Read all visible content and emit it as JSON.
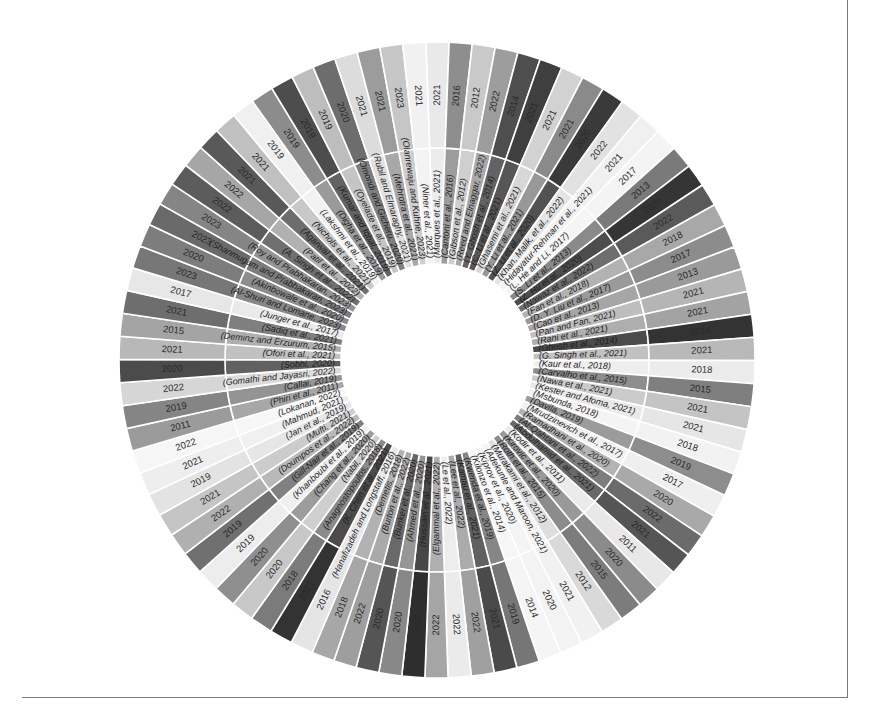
{
  "chart_data": {
    "type": "sunburst",
    "title": "",
    "center": {
      "x": 437,
      "y": 360
    },
    "radii": {
      "inner": 96,
      "split": 212,
      "outer": 318
    },
    "start_angle_deg": -2,
    "entries": [
      {
        "author": "(Marques et al., 2021)",
        "year": 2021,
        "shade": "#e9e9e9"
      },
      {
        "author": "(Cantoni et al., 2016)",
        "year": 2016,
        "shade": "#8e8e8e"
      },
      {
        "author": "(Gibson et al., 2012)",
        "year": 2012,
        "shade": "#c9c9c9"
      },
      {
        "author": "(Reed and Elnaggar, 2022)",
        "year": 2022,
        "shade": "#9d9d9d"
      },
      {
        "author": "(Y. Ghosh et al., 2014)",
        "year": 2014,
        "shade": "#4e4e4e"
      },
      {
        "author": "(C. Li et al., 2021)",
        "year": 2021,
        "shade": "#3f3f3f"
      },
      {
        "author": "(Ghasemi et al., 2021)",
        "year": 2021,
        "shade": "#d2d2d2"
      },
      {
        "author": "(Y. Li et al., 2021)",
        "year": 2021,
        "shade": "#8a8a8a"
      },
      {
        "author": "(Z. Li et al., 2020)",
        "year": 2020,
        "shade": "#3a3a3a"
      },
      {
        "author": "(Khan, Malik, et al., 2022)",
        "year": 2022,
        "shade": "#e2e2e2"
      },
      {
        "author": "(Hidayatur-Rehman et al., 2021)",
        "year": 2021,
        "shade": "#f0f0f0"
      },
      {
        "author": "(L. He and Li, 2017)",
        "year": 2017,
        "shade": "#f4f4f4"
      },
      {
        "author": "(S. Li et al., 2013)",
        "year": 2013,
        "shade": "#7a7a7a"
      },
      {
        "author": "(Z. Hu et al., 2020)",
        "year": 2020,
        "shade": "#353535"
      },
      {
        "author": "(Nawaz et al., 2022)",
        "year": 2022,
        "shade": "#5a5a5a"
      },
      {
        "author": "(Fan et al., 2018)",
        "year": 2018,
        "shade": "#a8a8a8"
      },
      {
        "author": "(D. Y. Liu et al., 2017)",
        "year": 2017,
        "shade": "#8c8c8c"
      },
      {
        "author": "(Cao et al., 2013)",
        "year": 2013,
        "shade": "#9a9a9a"
      },
      {
        "author": "(Pan and Fan, 2021)",
        "year": 2021,
        "shade": "#b5b5b5"
      },
      {
        "author": "(Rani et al., 2021)",
        "year": 2021,
        "shade": "#a3a3a3"
      },
      {
        "author": "(Ghosh et al., 2014)",
        "year": 2014,
        "shade": "#333333"
      },
      {
        "author": "(G. Singh et al., 2021)",
        "year": 2021,
        "shade": "#b9b9b9"
      },
      {
        "author": "(Kaur et al., 2018)",
        "year": 2018,
        "shade": "#ececec"
      },
      {
        "author": "(Carvalho et al., 2015)",
        "year": 2015,
        "shade": "#7f7f7f"
      },
      {
        "author": "(Nawa et al., 2021)",
        "year": 2021,
        "shade": "#c4c4c4"
      },
      {
        "author": "(Kester and Afoma, 2021)",
        "year": 2021,
        "shade": "#e6e6e6"
      },
      {
        "author": "(Msbunda, 2018)",
        "year": 2018,
        "shade": "#f2f2f2"
      },
      {
        "author": "(Davila, 2019)",
        "year": 2019,
        "shade": "#8d8d8d"
      },
      {
        "author": "(Mrudzinevich et al., 2017)",
        "year": 2017,
        "shade": "#efefef"
      },
      {
        "author": "(Ramadhani et al., 2020)",
        "year": 2020,
        "shade": "#a9a9a9"
      },
      {
        "author": "(Al-Qahtani et al., 2022)",
        "year": 2022,
        "shade": "#6b6b6b"
      },
      {
        "author": "(Abdulhamid et al., 2021)",
        "year": 2021,
        "shade": "#555555"
      },
      {
        "author": "(Kodir et al., 2011)",
        "year": 2011,
        "shade": "#e8e8e8"
      },
      {
        "author": "(Kirovic et al., 2020)",
        "year": 2020,
        "shade": "#8b8b8b"
      },
      {
        "author": "(Roth et al., 2015)",
        "year": 2015,
        "shade": "#7c7c7c"
      },
      {
        "author": "(Murakami et al., 2012)",
        "year": 2012,
        "shade": "#d9d9d9"
      },
      {
        "author": "(Adekunle and Maroon, 2021)",
        "year": 2021,
        "shade": "#f1f1f1"
      },
      {
        "author": "(Kiprov et al., 2020)",
        "year": 2020,
        "shade": "#f3f3f3"
      },
      {
        "author": "(Kilonzo et al., 2014)",
        "year": 2014,
        "shade": "#f5f5f5"
      },
      {
        "author": "(Kwenda et al., 2019)",
        "year": 2019,
        "shade": "#767676"
      },
      {
        "author": "(Kamau et al., 2021)",
        "year": 2021,
        "shade": "#4a4a4a"
      },
      {
        "author": "(Lee et al., 2022)",
        "year": 2022,
        "shade": "#a0a0a0"
      },
      {
        "author": "(Le et al., 2022)",
        "year": 2022,
        "shade": "#ebebeb"
      },
      {
        "author": "(Elgammal et al., 2022)",
        "year": 2022,
        "shade": "#a5a5a5"
      },
      {
        "author": "(Hussain et al., 2021)",
        "year": 2021,
        "shade": "#2e2e2e"
      },
      {
        "author": "(Ahmed et al., 2020)",
        "year": 2020,
        "shade": "#888888"
      },
      {
        "author": "(Bunker et al., 2020)",
        "year": 2020,
        "shade": "#555555"
      },
      {
        "author": "(Burton et al., 2022)",
        "year": 2022,
        "shade": "#9e9e9e"
      },
      {
        "author": "(Demetis, 2018)",
        "year": 2018,
        "shade": "#a7a7a7"
      },
      {
        "author": "(Hanafizadeh and Longstaff, 2016)",
        "year": 2016,
        "shade": "#e5e5e5"
      },
      {
        "author": "(K. Chen et al., 2021)",
        "year": 2021,
        "shade": "#333333"
      },
      {
        "author": "(Anagnostopoulos, 2018)",
        "year": 2018,
        "shade": "#7b7b7b"
      },
      {
        "author": "(Nabil, 2020)",
        "year": 2020,
        "shade": "#c8c8c8"
      },
      {
        "author": "(Chang et al., 2020)",
        "year": 2020,
        "shade": "#8f8f8f"
      },
      {
        "author": "(Khanboubi et al., 2019)",
        "year": 2019,
        "shade": "#ededed"
      },
      {
        "author": "(Gill-Nair et al., 2019)",
        "year": 2019,
        "shade": "#707070"
      },
      {
        "author": "(Doumpos et al., 2022)",
        "year": 2022,
        "shade": "#b0b0b0"
      },
      {
        "author": "(Mufti, 2021)",
        "year": 2021,
        "shade": "#c5c5c5"
      },
      {
        "author": "(Jan et al., 2019)",
        "year": 2019,
        "shade": "#e3e3e3"
      },
      {
        "author": "(Mahmud, 2021)",
        "year": 2021,
        "shade": "#eeeeee"
      },
      {
        "author": "(Lokanan, 2022)",
        "year": 2022,
        "shade": "#f6f6f6"
      },
      {
        "author": "(Phiri et al., 2011)",
        "year": 2011,
        "shade": "#9b9b9b"
      },
      {
        "author": "(Callai, 2019)",
        "year": 2019,
        "shade": "#858585"
      },
      {
        "author": "(Gomathi and Jayasri, 2022)",
        "year": 2022,
        "shade": "#d6d6d6"
      },
      {
        "author": "(Sobhi, 2020)",
        "year": 2020,
        "shade": "#4b4b4b"
      },
      {
        "author": "(Ofori et al., 2021)",
        "year": 2021,
        "shade": "#b8b8b8"
      },
      {
        "author": "(Deminz and Erzurum, 2015)",
        "year": 2015,
        "shade": "#a4a4a4"
      },
      {
        "author": "(Sadiq et al., 2021)",
        "year": 2021,
        "shade": "#6e6e6e"
      },
      {
        "author": "(Junger et al., 2017)",
        "year": 2017,
        "shade": "#e7e7e7"
      },
      {
        "author": "(Al-Shuri and Lomane, 2023)",
        "year": 2023,
        "shade": "#777777"
      },
      {
        "author": "(Akinbowale et al., 2020)",
        "year": 2020,
        "shade": "#7d7d7d"
      },
      {
        "author": "(Shanmugam and Prabhakaran, 2023)",
        "year": 2023,
        "shade": "#6a6a6a"
      },
      {
        "author": "(Roy and Prabhakaran, 2023)",
        "year": 2023,
        "shade": "#858585"
      },
      {
        "author": "(A. Singh et al., 2022)",
        "year": 2022,
        "shade": "#5c5c5c"
      },
      {
        "author": "(Patil et al., 2022)",
        "year": 2022,
        "shade": "#a6a6a6"
      },
      {
        "author": "(Agarwal et al., 2021)",
        "year": 2021,
        "shade": "#595959"
      },
      {
        "author": "(Nichols et al., 2021)",
        "year": 2021,
        "shade": "#c0c0c0"
      },
      {
        "author": "(Lakshmi et al., 2019)",
        "year": 2019,
        "shade": "#f0f0f0"
      },
      {
        "author": "(Digha et al., 2019)",
        "year": 2019,
        "shade": "#8c8c8c"
      },
      {
        "author": "(Kumar and Iqbal, 2019)",
        "year": 2019,
        "shade": "#4d4d4d"
      },
      {
        "author": "(Oyelade et al., 2019)",
        "year": 2019,
        "shade": "#bdbdbd"
      },
      {
        "author": "(Omondi and Gicheru, 2020)",
        "year": 2020,
        "shade": "#6d6d6d"
      },
      {
        "author": "(Rubil and Elmaraghy, 2021)",
        "year": 2021,
        "shade": "#dcdcdc"
      },
      {
        "author": "(Mehrotra et al., 2021)",
        "year": 2021,
        "shade": "#9c9c9c"
      },
      {
        "author": "(Olanrewaju and Kuhne, 2023)",
        "year": 2023,
        "shade": "#c6c6c6"
      },
      {
        "author": "(Niner et al., 2021)",
        "year": 2021,
        "shade": "#f1f1f1"
      }
    ]
  }
}
